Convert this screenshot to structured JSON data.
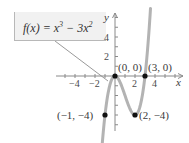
{
  "chart_data": {
    "type": "line",
    "title": "",
    "function_label": "f(x) = x^3 - 3x^2",
    "function_parts": {
      "lhs": "f(x) = x",
      "exp1": "3",
      "mid": " − 3x",
      "exp2": "2"
    },
    "xlabel": "x",
    "ylabel": "y",
    "x_ticks": [
      {
        "value": -4,
        "label": "−4"
      },
      {
        "value": -2,
        "label": "−2"
      },
      {
        "value": 2,
        "label": "2"
      },
      {
        "value": 4,
        "label": "4"
      }
    ],
    "y_ticks": [
      {
        "value": 4,
        "label": "4"
      },
      {
        "value": 2,
        "label": "2"
      }
    ],
    "xlim": [
      -6,
      6.5
    ],
    "ylim": [
      -6.5,
      6.5
    ],
    "grid": false,
    "series": [
      {
        "name": "f(x) = x^3 - 3x^2",
        "x_range": [
          -1.3,
          3.55
        ],
        "color": "#b3b3b3"
      }
    ],
    "points": [
      {
        "x": 0,
        "y": 0,
        "label": "(0, 0)"
      },
      {
        "x": 3,
        "y": 0,
        "label": "(3, 0)"
      },
      {
        "x": -1,
        "y": -4,
        "label": "(−1, −4)"
      },
      {
        "x": 2,
        "y": -4,
        "label": "(2, −4)"
      }
    ],
    "colors": {
      "curve": "#b3b3b3",
      "axis": "#8a8a8a",
      "point": "#111111",
      "label_box": "#f1f1f1"
    }
  }
}
